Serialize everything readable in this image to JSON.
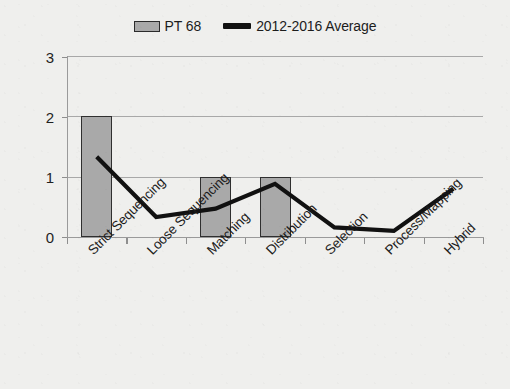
{
  "legend": {
    "position": "top-center",
    "entries": [
      {
        "label": "PT 68",
        "marker": "bar-swatch-icon",
        "color": "#a9a9a9"
      },
      {
        "label": "2012-2016 Average",
        "marker": "line-swatch-icon",
        "color": "#111111"
      }
    ]
  },
  "axes": {
    "y_ticks": [
      "0",
      "1",
      "2",
      "3"
    ],
    "x_ticks_count": 8
  },
  "chart_data": {
    "type": "bar",
    "title": "",
    "subtitle": "",
    "xlabel": "",
    "ylabel": "",
    "ylim": [
      0,
      3
    ],
    "yticks": [
      0,
      1,
      2,
      3
    ],
    "grid": true,
    "legend_position": "top-center",
    "categories": [
      "Strict Sequencing",
      "Loose Sequencing",
      "Matching",
      "Distribution",
      "Selection",
      "Process/Mapping",
      "Hybrid"
    ],
    "series": [
      {
        "name": "PT 68",
        "type": "bar",
        "color": "#a9a9a9",
        "edge_color": "#2f2f2f",
        "values": [
          2,
          0,
          1,
          1,
          0,
          0,
          0
        ]
      },
      {
        "name": "2012-2016 Average",
        "type": "line",
        "color": "#111111",
        "values": [
          1.33,
          0.33,
          0.47,
          0.88,
          0.16,
          0.1,
          0.8
        ]
      }
    ]
  }
}
